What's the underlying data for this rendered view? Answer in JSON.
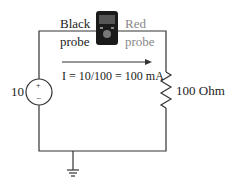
{
  "labels": {
    "black_probe_line1": "Black",
    "black_probe_line2": "probe",
    "red_probe_line1": "Red",
    "red_probe_line2": "probe",
    "current_eq": "I = 10/100 = 100 mA",
    "source_value": "10",
    "resistor_value": "100 Ohm",
    "plus": "+",
    "minus": "−"
  },
  "colors": {
    "wire": "#333333",
    "meter_body": "#1a1a1a",
    "red_probe_text": "#888888"
  }
}
